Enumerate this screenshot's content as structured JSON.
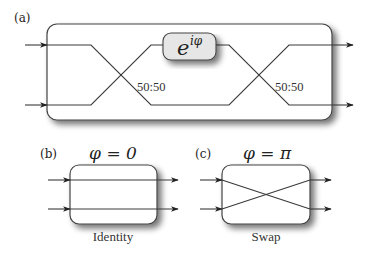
{
  "figure": {
    "panel_a": {
      "label": "(a)",
      "phase_shifter": {
        "text_base": "e",
        "text_exponent": "iφ",
        "fill": "#e6e6e6"
      },
      "beam_splitters": [
        {
          "ratio_label": "50:50"
        },
        {
          "ratio_label": "50:50"
        }
      ],
      "inputs": 2,
      "outputs": 2
    },
    "panel_b": {
      "label": "(b)",
      "condition": "φ = 0",
      "caption": "Identity"
    },
    "panel_c": {
      "label": "(c)",
      "condition": "φ = π",
      "caption": "Swap"
    },
    "colors": {
      "line": "#3a3a3a",
      "splitter": "#111111",
      "box_border": "#444444",
      "shadow": "#888888"
    }
  }
}
